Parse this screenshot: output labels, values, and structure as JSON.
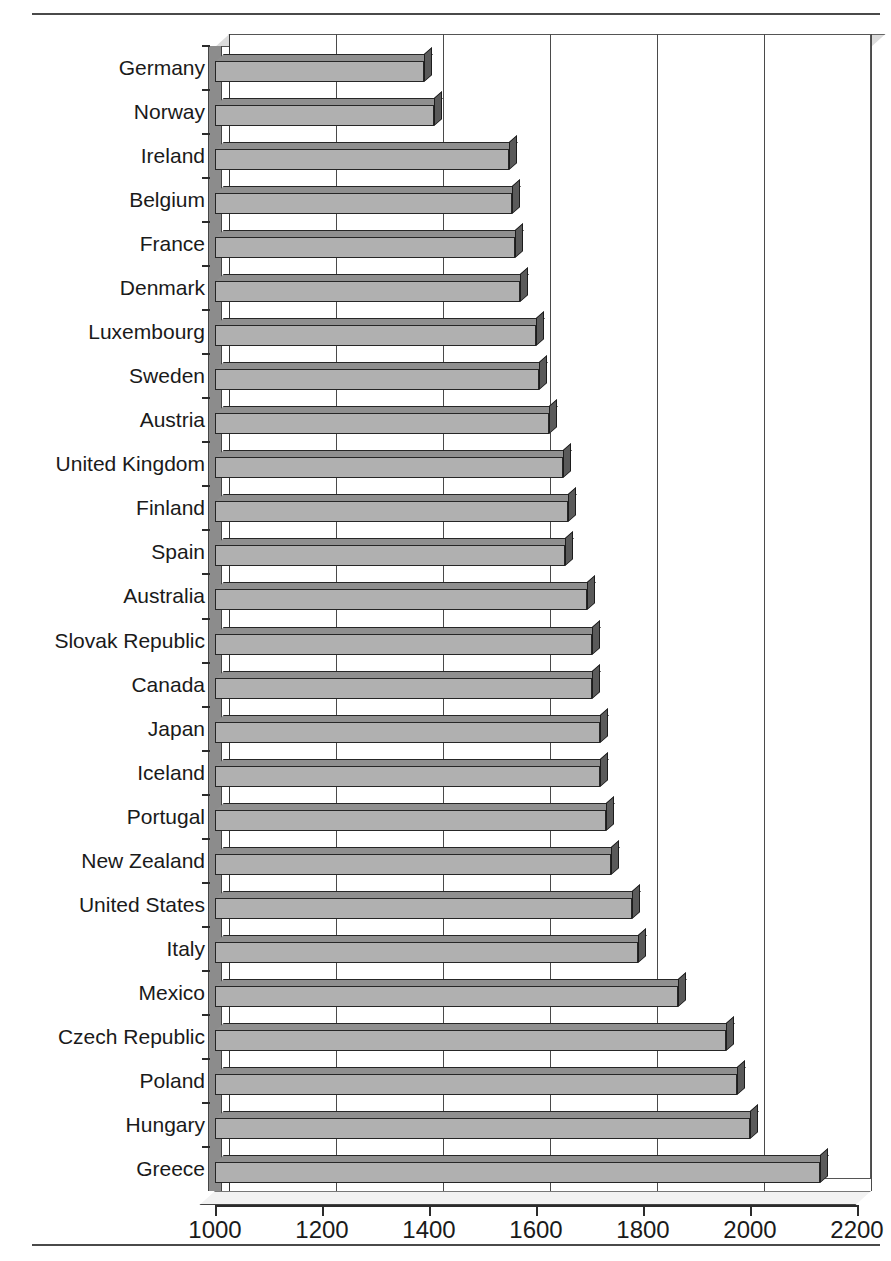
{
  "figure": {
    "rules": {
      "top": "horizontal-rule",
      "bottom": "horizontal-rule"
    }
  },
  "chart_data": {
    "type": "bar",
    "orientation": "horizontal",
    "title": "",
    "subtitle": "",
    "xlabel": "",
    "ylabel": "",
    "xlim": [
      1000,
      2200
    ],
    "xticks": [
      1000,
      1200,
      1400,
      1600,
      1800,
      2000,
      2200
    ],
    "xticklabels": [
      "1000",
      "1200",
      "1400",
      "1600",
      "1800",
      "2000",
      "2200"
    ],
    "grid": true,
    "grid_axis": "x",
    "legend": false,
    "style": "3d-bar",
    "categories": [
      "Germany",
      "Norway",
      "Ireland",
      "Belgium",
      "France",
      "Denmark",
      "Luxembourg",
      "Sweden",
      "Austria",
      "United Kingdom",
      "Finland",
      "Spain",
      "Australia",
      "Slovak Republic",
      "Canada",
      "Japan",
      "Iceland",
      "Portugal",
      "New Zealand",
      "United States",
      "Italy",
      "Mexico",
      "Czech Republic",
      "Poland",
      "Hungary",
      "Greece"
    ],
    "values": [
      1390,
      1410,
      1550,
      1555,
      1560,
      1570,
      1600,
      1605,
      1625,
      1650,
      1660,
      1655,
      1695,
      1705,
      1705,
      1720,
      1720,
      1730,
      1740,
      1780,
      1790,
      1865,
      1955,
      1975,
      2000,
      2130
    ]
  }
}
